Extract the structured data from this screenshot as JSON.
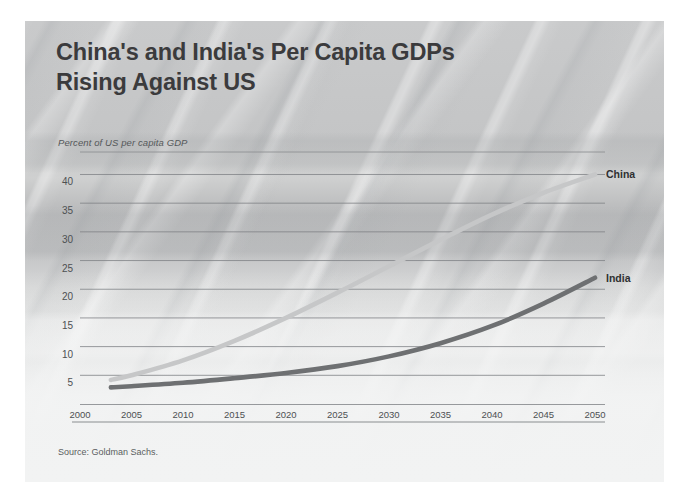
{
  "slide": {
    "title": "China's and India's Per Capita GDPs\nRising Against US",
    "source": "Source: Goldman Sachs."
  },
  "chart_data": {
    "type": "line",
    "title": "China's and India's Per Capita GDPs Rising Against US",
    "subtitle": "",
    "xlabel": "",
    "ylabel": "Percent of US per capita GDP",
    "axis_note": "Percent of US per capita GDP",
    "xlim": [
      2000,
      2050
    ],
    "ylim": [
      0,
      42
    ],
    "yticks": [
      5,
      10,
      15,
      20,
      25,
      30,
      35,
      40
    ],
    "xticks": [
      2000,
      2005,
      2010,
      2015,
      2020,
      2025,
      2030,
      2035,
      2040,
      2045,
      2050
    ],
    "grid": true,
    "legend_position": "right-of-line-ends",
    "x": [
      2003,
      2005,
      2010,
      2015,
      2020,
      2025,
      2030,
      2035,
      2040,
      2045,
      2050
    ],
    "series": [
      {
        "name": "China",
        "color": "#c6c7c8",
        "values": [
          4.2,
          5.0,
          7.6,
          11.0,
          15.0,
          19.4,
          24.0,
          28.6,
          33.0,
          36.8,
          40.0
        ]
      },
      {
        "name": "India",
        "color": "#6e7072",
        "values": [
          2.9,
          3.1,
          3.7,
          4.5,
          5.4,
          6.6,
          8.3,
          10.6,
          13.6,
          17.5,
          22.0
        ]
      }
    ],
    "annotations": [
      {
        "text": "China",
        "x": 2050,
        "y": 40
      },
      {
        "text": "India",
        "x": 2050,
        "y": 22
      }
    ],
    "source": "Source: Goldman Sachs."
  }
}
